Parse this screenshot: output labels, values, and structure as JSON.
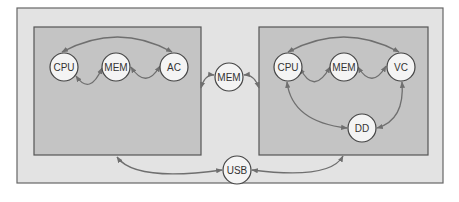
{
  "diagram": {
    "outer_container": {
      "x": 17,
      "y": 8,
      "w": 426,
      "h": 175
    },
    "left_system": {
      "box": {
        "x": 34,
        "y": 27,
        "w": 167,
        "h": 128
      },
      "nodes": [
        {
          "id": "cpu",
          "label": "CPU",
          "cx": 64,
          "cy": 67
        },
        {
          "id": "mem",
          "label": "MEM",
          "cx": 116,
          "cy": 67
        },
        {
          "id": "ac",
          "label": "AC",
          "cx": 174,
          "cy": 67
        }
      ]
    },
    "shared_nodes": [
      {
        "id": "mem_shared",
        "label": "MEM",
        "cx": 229,
        "cy": 77
      },
      {
        "id": "usb",
        "label": "USB",
        "cx": 237,
        "cy": 170
      }
    ],
    "right_system": {
      "box": {
        "x": 259,
        "y": 27,
        "w": 169,
        "h": 128
      },
      "nodes": [
        {
          "id": "cpu",
          "label": "CPU",
          "cx": 288,
          "cy": 67
        },
        {
          "id": "mem",
          "label": "MEM",
          "cx": 344,
          "cy": 67
        },
        {
          "id": "vc",
          "label": "VC",
          "cx": 401,
          "cy": 67
        },
        {
          "id": "dd",
          "label": "DD",
          "cx": 362,
          "cy": 128
        }
      ]
    },
    "edges": [
      "left.cpu <-> left.ac (arc over top)",
      "left.cpu <-> left.mem",
      "left.mem <-> left.ac",
      "left_box <-> mem_shared",
      "mem_shared <-> right_box",
      "right.cpu <-> right.vc (arc over top)",
      "right.cpu <-> right.mem",
      "right.mem <-> right.vc",
      "right.cpu <-> right.dd",
      "right.vc <-> right.dd",
      "left_box <-> usb",
      "usb <-> right_box"
    ],
    "colors": {
      "outer_fill": "#e3e3e3",
      "inner_fill": "#c4c4c4",
      "border": "#555555",
      "edge": "#6f6f6f",
      "node_fill": "#f4f4f4",
      "node_stroke": "#444444"
    }
  }
}
